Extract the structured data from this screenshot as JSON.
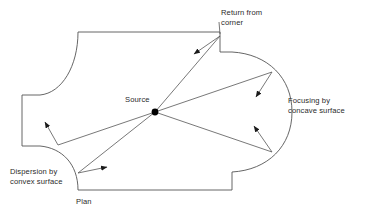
{
  "figure": {
    "type": "architectural-acoustics-plan",
    "caption": "Plan",
    "stroke_color": "#555555",
    "text_color": "#2b2b2b",
    "source_marker_color": "#000000"
  },
  "labels": {
    "return_from_corner": "Return from\ncorner",
    "source": "Source",
    "focusing_by_concave_surface": "Focusing by\nconcave surface",
    "dispersion_by_convex_surface": "Dispersion by\nconvex surface",
    "plan": "Plan"
  },
  "geometry": {
    "source_point": {
      "x": 155,
      "y": 112
    },
    "outline_description": "Room plan with concave apse on right, convex bulge at lower left, S-curves at upper left, stepped corners top-right and bottom-right",
    "reflection_points": [
      {
        "name": "corner",
        "x": 220,
        "y": 36
      },
      {
        "name": "upper-apse",
        "x": 272,
        "y": 72
      },
      {
        "name": "lower-apse",
        "x": 272,
        "y": 152
      },
      {
        "name": "convex-upper",
        "x": 58,
        "y": 145
      },
      {
        "name": "convex-lower",
        "x": 78,
        "y": 173
      }
    ]
  }
}
